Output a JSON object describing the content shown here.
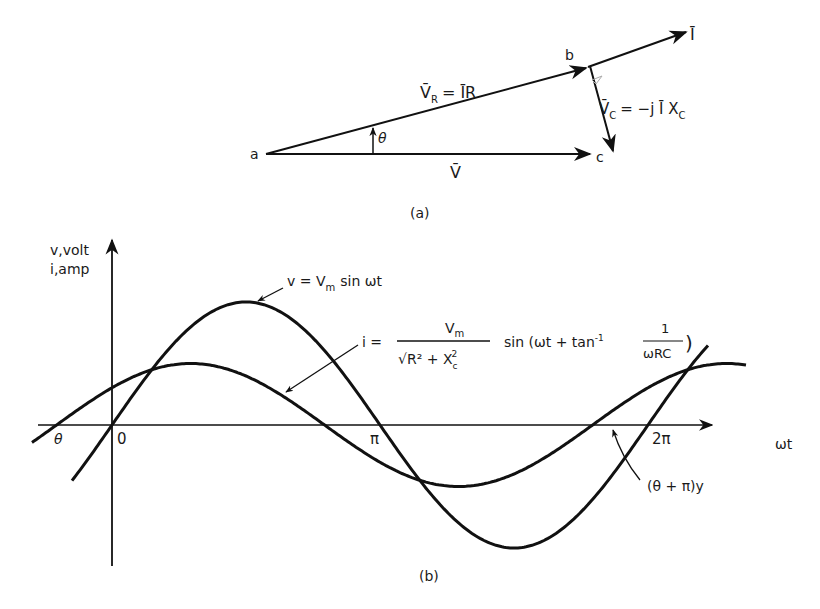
{
  "part_a": {
    "caption": "(a)",
    "points": {
      "a": "a",
      "b": "b",
      "c": "c"
    },
    "vectors": {
      "current": "Ī",
      "voltage_resistor_lhs": "V̄",
      "voltage_resistor_sub": "R",
      "voltage_resistor_rhs": "= ĪR",
      "voltage_capacitor_lhs": "V̄",
      "voltage_capacitor_sub": "C",
      "voltage_capacitor_rhs": "= −j Ī X",
      "voltage_capacitor_rhs_sub": "C",
      "voltage_total": "V̄"
    },
    "angle_label": "θ"
  },
  "part_b": {
    "caption": "(b)",
    "y_axis_label_line1": "v,volt",
    "y_axis_label_line2": "i,amp",
    "x_axis_label": "ωt",
    "ticks": {
      "origin": "0",
      "theta": "θ",
      "pi": "π",
      "two_pi": "2π"
    },
    "voltage_curve_label": {
      "lhs": "v = V",
      "sub": "m",
      "rhs": "sin ωt"
    },
    "current_curve_label": {
      "lhs": "i =",
      "numerator": "V",
      "numerator_sub": "m",
      "denominator": "√R² + X",
      "denominator_sub": "c",
      "denominator_sup": "2",
      "rhs": "sin (ωt + tan",
      "rhs_sup": "-1",
      "frac2_num": "1",
      "frac2_den": "ωRC",
      "close": ")"
    },
    "crossing_label": "(θ + π)y"
  },
  "chart_data": {
    "type": "line",
    "title": "",
    "xlabel": "ωt",
    "ylabel": "v,volt / i,amp",
    "series": [
      {
        "name": "v = Vm sin ωt",
        "amplitude": 1.0,
        "phase_rad": 0.0
      },
      {
        "name": "i = Vm/√(R²+Xc²) sin(ωt + tan⁻¹(1/ωRC))",
        "amplitude": 0.5,
        "phase_rad": 0.65
      }
    ],
    "x_ticks": [
      "θ",
      "0",
      "π",
      "2π"
    ],
    "xlim": [
      -0.8,
      2.4
    ],
    "grid": false
  },
  "colors": {
    "ink": "#111111",
    "background": "#ffffff",
    "faint": "#bbbbbb"
  }
}
